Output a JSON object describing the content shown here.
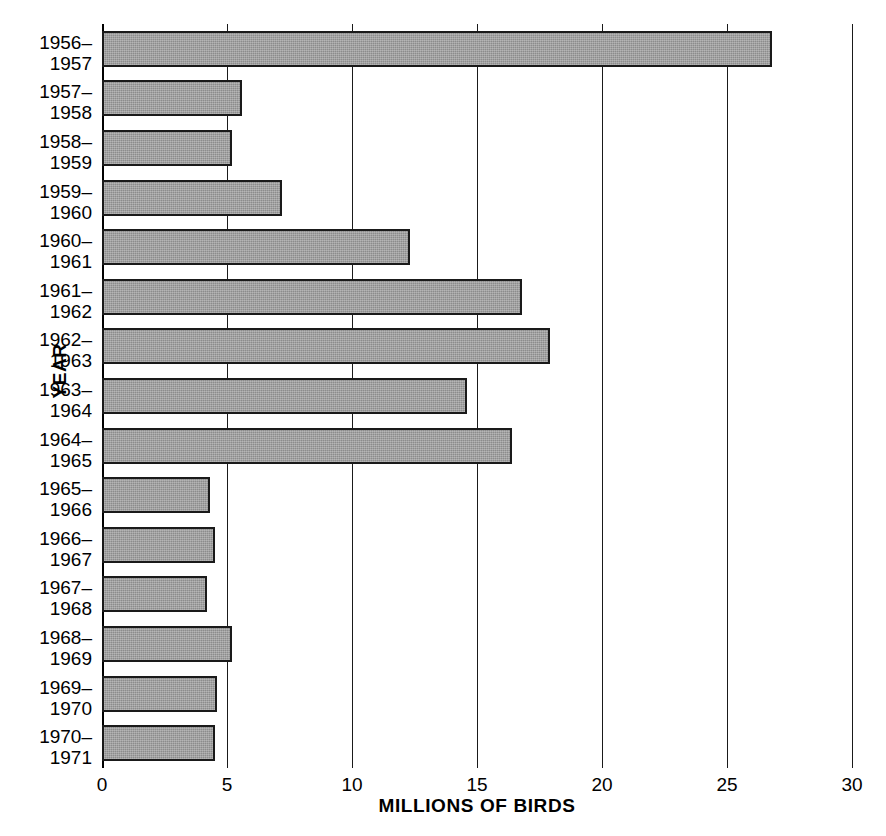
{
  "chart_data": {
    "type": "bar",
    "orientation": "horizontal",
    "title": "",
    "xlabel": "MILLIONS OF BIRDS",
    "ylabel": "YEAR",
    "xlim": [
      0,
      30
    ],
    "xticks": [
      0,
      5,
      10,
      15,
      20,
      25,
      30
    ],
    "xtick_labels": [
      "0",
      "5",
      "10",
      "15",
      "20",
      "25",
      "30"
    ],
    "grid": "vertical",
    "legend": "none",
    "bar_color": "#8c8c8c",
    "bar_edge_color": "#1a1a1a",
    "categories": [
      "1956–\n1957",
      "1957–\n1958",
      "1958–\n1959",
      "1959–\n1960",
      "1960–\n1961",
      "1961–\n1962",
      "1962–\n1963",
      "1963–\n1964",
      "1964–\n1965",
      "1965–\n1966",
      "1966–\n1967",
      "1967–\n1968",
      "1968–\n1969",
      "1969–\n1970",
      "1970–\n1971"
    ],
    "values": [
      26.8,
      5.6,
      5.2,
      7.2,
      12.3,
      16.8,
      17.9,
      14.6,
      16.4,
      4.3,
      4.5,
      4.2,
      5.2,
      4.6,
      4.5
    ],
    "bars": [
      {
        "label_line1": "1956–",
        "label_line2": "1957",
        "value": 26.8
      },
      {
        "label_line1": "1957–",
        "label_line2": "1958",
        "value": 5.6
      },
      {
        "label_line1": "1958–",
        "label_line2": "1959",
        "value": 5.2
      },
      {
        "label_line1": "1959–",
        "label_line2": "1960",
        "value": 7.2
      },
      {
        "label_line1": "1960–",
        "label_line2": "1961",
        "value": 12.3
      },
      {
        "label_line1": "1961–",
        "label_line2": "1962",
        "value": 16.8
      },
      {
        "label_line1": "1962–",
        "label_line2": "1963",
        "value": 17.9
      },
      {
        "label_line1": "1963–",
        "label_line2": "1964",
        "value": 14.6
      },
      {
        "label_line1": "1964–",
        "label_line2": "1965",
        "value": 16.4
      },
      {
        "label_line1": "1965–",
        "label_line2": "1966",
        "value": 4.3
      },
      {
        "label_line1": "1966–",
        "label_line2": "1967",
        "value": 4.5
      },
      {
        "label_line1": "1967–",
        "label_line2": "1968",
        "value": 4.2
      },
      {
        "label_line1": "1968–",
        "label_line2": "1969",
        "value": 5.2
      },
      {
        "label_line1": "1969–",
        "label_line2": "1970",
        "value": 4.6
      },
      {
        "label_line1": "1970–",
        "label_line2": "1971",
        "value": 4.5
      }
    ]
  },
  "axes": {
    "x_title": "MILLIONS OF BIRDS",
    "y_title": "YEAR"
  }
}
